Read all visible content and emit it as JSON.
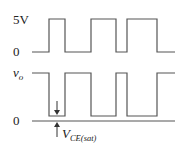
{
  "labels": {
    "top_high": "5V",
    "top_low": "0",
    "bottom_signal": "v",
    "bottom_signal_sub": "o",
    "bottom_zero": "0",
    "annotation_main": "V",
    "annotation_sub": "CE(sat)"
  },
  "waveforms": {
    "input": {
      "high_y": 19,
      "low_y": 52,
      "start_x": 32,
      "end_x": 175,
      "transitions_x": [
        49,
        65,
        91,
        116,
        127,
        157
      ]
    },
    "output": {
      "high_y": 73,
      "low_y": 116,
      "baseline_y": 121,
      "start_x": 32,
      "end_x": 175,
      "transitions_x": [
        49,
        65,
        91,
        116,
        127,
        157
      ]
    }
  },
  "colors": {
    "line": "#555555",
    "text": "#222222"
  }
}
